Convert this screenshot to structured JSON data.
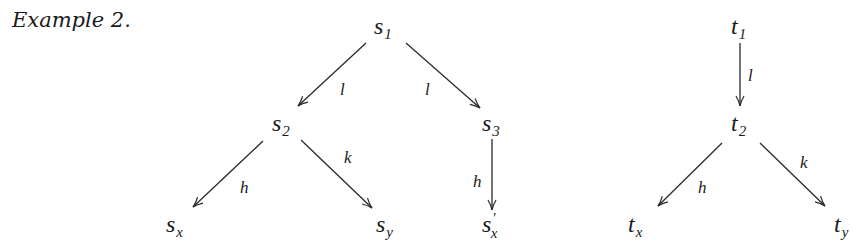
{
  "caption": "Example 2.",
  "diagram": {
    "trees": [
      {
        "name": "s-tree",
        "nodes": [
          {
            "id": "s1",
            "base": "s",
            "sub": "1",
            "prime": "",
            "x": 374,
            "y": 34
          },
          {
            "id": "s2",
            "base": "s",
            "sub": "2",
            "prime": "",
            "x": 272,
            "y": 131
          },
          {
            "id": "s3",
            "base": "s",
            "sub": "3",
            "prime": "",
            "x": 482,
            "y": 131
          },
          {
            "id": "sx",
            "base": "s",
            "sub": "x",
            "prime": "",
            "x": 166,
            "y": 232
          },
          {
            "id": "sy",
            "base": "s",
            "sub": "y",
            "prime": "",
            "x": 376,
            "y": 232
          },
          {
            "id": "sx_prime",
            "base": "s",
            "sub": "x",
            "prime": "′",
            "x": 482,
            "y": 232
          }
        ],
        "edges": [
          {
            "from": "s1",
            "to": "s2",
            "label": "l",
            "x1": 366,
            "y1": 43,
            "x2": 298,
            "y2": 106,
            "lx": 340,
            "ly": 95
          },
          {
            "from": "s1",
            "to": "s3",
            "label": "l",
            "x1": 406,
            "y1": 43,
            "x2": 480,
            "y2": 108,
            "lx": 425,
            "ly": 95
          },
          {
            "from": "s2",
            "to": "sx",
            "label": "h",
            "x1": 263,
            "y1": 141,
            "x2": 193,
            "y2": 207,
            "lx": 240,
            "ly": 193
          },
          {
            "from": "s2",
            "to": "sy",
            "label": "k",
            "x1": 301,
            "y1": 140,
            "x2": 372,
            "y2": 208,
            "lx": 344,
            "ly": 163
          },
          {
            "from": "s3",
            "to": "sx_prime",
            "label": "h",
            "x1": 492,
            "y1": 139,
            "x2": 492,
            "y2": 210,
            "lx": 473,
            "ly": 187
          }
        ]
      },
      {
        "name": "t-tree",
        "nodes": [
          {
            "id": "t1",
            "base": "t",
            "sub": "1",
            "prime": "",
            "x": 731,
            "y": 34
          },
          {
            "id": "t2",
            "base": "t",
            "sub": "2",
            "prime": "",
            "x": 731,
            "y": 131
          },
          {
            "id": "tx",
            "base": "t",
            "sub": "x",
            "prime": "",
            "x": 628,
            "y": 232
          },
          {
            "id": "ty",
            "base": "t",
            "sub": "y",
            "prime": "",
            "x": 834,
            "y": 232
          }
        ],
        "edges": [
          {
            "from": "t1",
            "to": "t2",
            "label": "l",
            "x1": 740,
            "y1": 43,
            "x2": 740,
            "y2": 106,
            "lx": 748,
            "ly": 81
          },
          {
            "from": "t2",
            "to": "tx",
            "label": "h",
            "x1": 722,
            "y1": 143,
            "x2": 658,
            "y2": 206,
            "lx": 698,
            "ly": 193
          },
          {
            "from": "t2",
            "to": "ty",
            "label": "k",
            "x1": 760,
            "y1": 143,
            "x2": 825,
            "y2": 206,
            "lx": 800,
            "ly": 168
          }
        ]
      }
    ]
  }
}
